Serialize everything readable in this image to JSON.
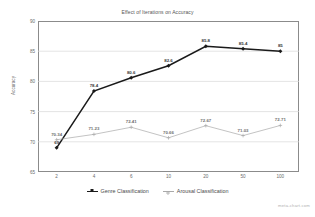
{
  "chart_data": {
    "type": "line",
    "title": "Effect of Iterations on Accuracy",
    "xlabel": "",
    "ylabel": "Accuracy",
    "categories": [
      "2",
      "4",
      "6",
      "10",
      "20",
      "50",
      "100"
    ],
    "ylim": [
      65,
      90
    ],
    "yticks": [
      90,
      85,
      80,
      75,
      70,
      65
    ],
    "grid": true,
    "legend_position": "bottom",
    "series": [
      {
        "name": "Genre Classification",
        "color": "#1a1a1a",
        "marker": "diamond",
        "values": [
          69,
          78.4,
          80.6,
          82.6,
          85.8,
          85.4,
          85
        ],
        "labels": [
          "69",
          "78.4",
          "80.6",
          "82.6",
          "85.8",
          "85.4",
          "85"
        ]
      },
      {
        "name": "Arousal Classification",
        "color": "#a9a9a9",
        "marker": "plus",
        "values": [
          70.34,
          71.23,
          72.41,
          70.66,
          72.67,
          71.03,
          72.71
        ],
        "labels": [
          "70.34",
          "71.23",
          "72.41",
          "70.66",
          "72.67",
          "71.03",
          "72.71"
        ]
      }
    ]
  },
  "watermark": "meta-chart.com",
  "colors": {
    "series_dark": "#1a1a1a",
    "series_light": "#a9a9a9",
    "axis": "#8b8b8b",
    "grid": "#d9d9d9",
    "tick_text": "#6b6b6b"
  }
}
